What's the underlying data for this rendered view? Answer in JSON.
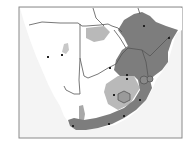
{
  "map": {
    "region": "Southern Africa",
    "frame": {
      "x": 19,
      "y": 7,
      "w": 163,
      "h": 131,
      "border_color": "#8a8a8a"
    },
    "colors": {
      "ocean": "#f4f4f4",
      "land": "#ffffff",
      "border": "#555555",
      "range_dark": "#7d7d7d",
      "range_light": "#b9b9b9",
      "point": "#222222"
    },
    "legend": {
      "range_dark": "primary distribution",
      "range_light": "secondary distribution",
      "point": "locality record"
    },
    "points": [
      {
        "x": 144,
        "y": 26
      },
      {
        "x": 169,
        "y": 38
      },
      {
        "x": 62,
        "y": 55
      },
      {
        "x": 48,
        "y": 57
      },
      {
        "x": 110,
        "y": 68
      },
      {
        "x": 127,
        "y": 75
      },
      {
        "x": 127,
        "y": 79
      },
      {
        "x": 114,
        "y": 95
      },
      {
        "x": 140,
        "y": 100
      },
      {
        "x": 124,
        "y": 116
      },
      {
        "x": 109,
        "y": 124
      },
      {
        "x": 73,
        "y": 126
      }
    ]
  }
}
